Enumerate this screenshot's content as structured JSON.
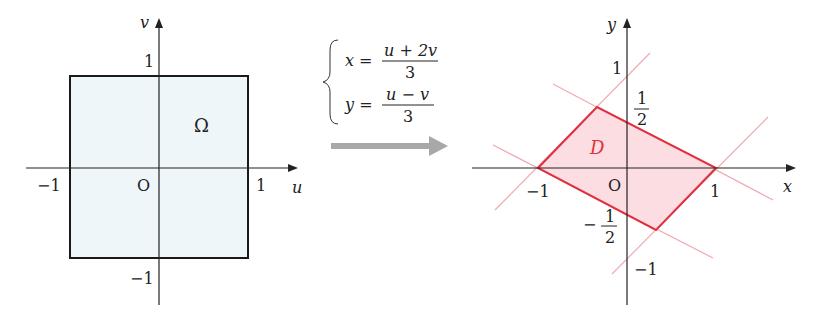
{
  "colors": {
    "axis": "#222222",
    "square_fill": "#eef6f9",
    "square_stroke": "#1a1a1a",
    "region_fill": "#fbdde2",
    "region_stroke": "#e0303f",
    "guide_lines": "#f2a9b3",
    "arrow": "#a8a8a8",
    "region_label": "#e0303f"
  },
  "left_plot": {
    "axis_u_label": "u",
    "axis_v_label": "v",
    "origin_label": "O",
    "tick_u_neg": "−1",
    "tick_u_pos": "1",
    "tick_v_pos": "1",
    "tick_v_neg": "−1",
    "region_label": "Ω",
    "region": {
      "u_range": [
        -1,
        1
      ],
      "v_range": [
        -1,
        1
      ]
    }
  },
  "transform": {
    "eq1_lhs": "x =",
    "eq1_num": "u + 2v",
    "eq1_den": "3",
    "eq2_lhs": "y =",
    "eq2_num": "u − v",
    "eq2_den": "3"
  },
  "right_plot": {
    "axis_x_label": "x",
    "axis_y_label": "y",
    "origin_label": "O",
    "tick_x_neg": "−1",
    "tick_x_pos": "1",
    "tick_y_pos": "1",
    "tick_y_neg": "−1",
    "tick_y_half_num": "1",
    "tick_y_half_den": "2",
    "tick_y_neg_half_sign": "−",
    "tick_y_neg_half_num": "1",
    "tick_y_neg_half_den": "2",
    "region_label": "D",
    "region_vertices": [
      [
        -1,
        0
      ],
      [
        -0.333,
        0.667
      ],
      [
        1,
        0
      ],
      [
        0.333,
        -0.667
      ]
    ]
  }
}
